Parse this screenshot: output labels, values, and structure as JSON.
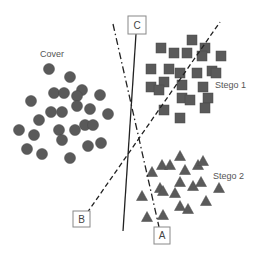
{
  "colors": {
    "marker": "#5a5a5a",
    "marker_stroke": "#4a4a4a",
    "line": "#222222",
    "box_stroke": "#888888",
    "text": "#555555"
  },
  "labels": {
    "cover": {
      "text": "Cover",
      "x": 40,
      "y": 57
    },
    "stego1": {
      "text": "Stego 1",
      "x": 215,
      "y": 88
    },
    "stego2": {
      "text": "Stego 2",
      "x": 213,
      "y": 179
    }
  },
  "boundaries": [
    {
      "id": "A",
      "label": "A",
      "style": "dash-dot",
      "x1": 113,
      "y1": 24,
      "x2": 159,
      "y2": 227,
      "box": {
        "x": 154,
        "y": 227,
        "w": 16,
        "h": 17
      }
    },
    {
      "id": "B",
      "label": "B",
      "style": "dashed",
      "x1": 87,
      "y1": 213,
      "x2": 220,
      "y2": 22,
      "box": {
        "x": 73,
        "y": 211,
        "w": 17,
        "h": 16
      }
    },
    {
      "id": "C",
      "label": "C",
      "style": "solid",
      "x1": 136,
      "y1": 34,
      "x2": 123,
      "y2": 231,
      "box": {
        "x": 128,
        "y": 16,
        "w": 18,
        "h": 18
      }
    }
  ],
  "clusters": {
    "cover": {
      "shape": "circle",
      "points": [
        [
          49,
          69
        ],
        [
          70,
          77
        ],
        [
          54,
          93
        ],
        [
          64,
          93
        ],
        [
          82,
          90
        ],
        [
          77,
          96
        ],
        [
          100,
          95
        ],
        [
          31,
          101
        ],
        [
          51,
          112
        ],
        [
          62,
          112
        ],
        [
          77,
          106
        ],
        [
          90,
          109
        ],
        [
          108,
          114
        ],
        [
          39,
          120
        ],
        [
          85,
          125
        ],
        [
          93,
          125
        ],
        [
          19,
          130
        ],
        [
          34,
          135
        ],
        [
          59,
          130
        ],
        [
          75,
          130
        ],
        [
          62,
          140
        ],
        [
          88,
          146
        ],
        [
          101,
          143
        ],
        [
          27,
          149
        ],
        [
          42,
          154
        ],
        [
          70,
          158
        ]
      ]
    },
    "stego1": {
      "shape": "square",
      "points": [
        [
          192,
          40
        ],
        [
          161,
          48
        ],
        [
          174,
          53
        ],
        [
          187,
          53
        ],
        [
          205,
          48
        ],
        [
          202,
          56
        ],
        [
          221,
          56
        ],
        [
          151,
          69
        ],
        [
          169,
          69
        ],
        [
          180,
          73
        ],
        [
          197,
          73
        ],
        [
          212,
          71
        ],
        [
          216,
          73
        ],
        [
          164,
          82
        ],
        [
          151,
          87
        ],
        [
          159,
          90
        ],
        [
          182,
          85
        ],
        [
          203,
          87
        ],
        [
          182,
          98
        ],
        [
          190,
          100
        ],
        [
          208,
          98
        ],
        [
          164,
          110
        ],
        [
          205,
          108
        ],
        [
          180,
          118
        ]
      ]
    },
    "stego2": {
      "shape": "triangle",
      "points": [
        [
          180,
          156
        ],
        [
          162,
          165
        ],
        [
          170,
          165
        ],
        [
          152,
          172
        ],
        [
          185,
          170
        ],
        [
          198,
          165
        ],
        [
          203,
          161
        ],
        [
          180,
          182
        ],
        [
          193,
          186
        ],
        [
          201,
          182
        ],
        [
          219,
          188
        ],
        [
          160,
          188
        ],
        [
          163,
          191
        ],
        [
          175,
          193
        ],
        [
          142,
          196
        ],
        [
          206,
          201
        ],
        [
          180,
          206
        ],
        [
          188,
          209
        ],
        [
          147,
          217
        ],
        [
          163,
          215
        ]
      ]
    }
  }
}
